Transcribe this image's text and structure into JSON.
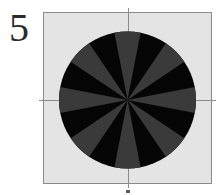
{
  "figure": {
    "label": "5",
    "caption_fragment": "",
    "background_color": "#ffffff"
  },
  "panel": {
    "plot_area": {
      "name": "image-plate",
      "fill_color": "#e4e4e4",
      "border_color": "#8c8c8c",
      "x": 43,
      "y": 12,
      "width": 169,
      "height": 172
    },
    "crosshair": {
      "color": "#8c8c8c",
      "vertical_x": 128,
      "horizontal_y": 100,
      "overhang": 4
    }
  },
  "chart_data": {
    "type": "pie",
    "title": "",
    "subtitle": "",
    "xlabel": "",
    "ylabel": "",
    "legend": [],
    "annotations": [],
    "grid": true,
    "center": {
      "x": 127.5,
      "y": 100.0
    },
    "radius": 68.5,
    "disk_color": "#050505",
    "wedge_color": "#3a3a3a",
    "slice_count": 8,
    "slice_angular_width_deg": 20,
    "categories": [
      "wedge-n",
      "wedge-ne",
      "wedge-e",
      "wedge-se",
      "wedge-s",
      "wedge-sw",
      "wedge-w",
      "wedge-nw"
    ],
    "values": [
      45,
      45,
      45,
      45,
      45,
      45,
      45,
      45
    ],
    "angles_deg": [
      90,
      45,
      0,
      315,
      270,
      225,
      180,
      135
    ],
    "wedge_inner_radius": 0,
    "wedge_outer_radius": 68.5,
    "arm_half_width_deg": 11
  }
}
